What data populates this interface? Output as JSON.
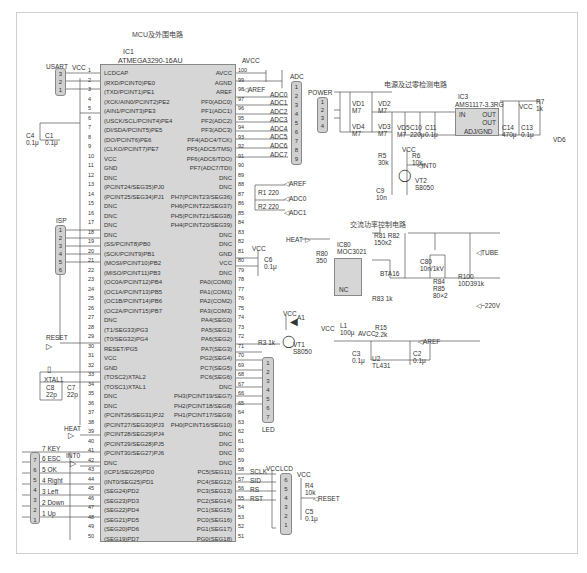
{
  "titles": {
    "mcu": "MCU及外围电路",
    "power": "电源及过零检测电路",
    "ac": "交流功率控制电路"
  },
  "mcu": {
    "ref": "IC1",
    "part": "ATMEGA3290-16AU",
    "left_pins": [
      {
        "n": "1",
        "name": "LCDCAP"
      },
      {
        "n": "2",
        "name": "(RXD/PCINT0)PE0"
      },
      {
        "n": "3",
        "name": "(TXD/PCINT1)PE1"
      },
      {
        "n": "4",
        "name": "(XCK/AIN0/PCINT2)PE2"
      },
      {
        "n": "5",
        "name": "(AIN1/PCINT3)PE3"
      },
      {
        "n": "6",
        "name": "(USCK/SCL/PCINT4)PE4"
      },
      {
        "n": "7",
        "name": "(DI/SDA/PCINT5)PE5"
      },
      {
        "n": "8",
        "name": "(DO/PCINT6)PE6"
      },
      {
        "n": "9",
        "name": "(CLKO/PCINT7)PE7"
      },
      {
        "n": "10",
        "name": "VCC"
      },
      {
        "n": "11",
        "name": "GND"
      },
      {
        "n": "12",
        "name": "DNC"
      },
      {
        "n": "13",
        "name": "(PCINT24/SEG35)PJ0"
      },
      {
        "n": "14",
        "name": "(PCINT25/SEG34)PJ1"
      },
      {
        "n": "15",
        "name": "DNC"
      },
      {
        "n": "16",
        "name": "DNC"
      },
      {
        "n": "17",
        "name": "DNC"
      },
      {
        "n": "18",
        "name": "DNC"
      },
      {
        "n": "19",
        "name": "(SS/PCINT8)PB0"
      },
      {
        "n": "20",
        "name": "(SCK/PCINT9)PB1"
      },
      {
        "n": "21",
        "name": "(MOSI/PCINT10)PB2"
      },
      {
        "n": "22",
        "name": "(MISO/PCINT11)PB3"
      },
      {
        "n": "23",
        "name": "(OC0A/PCINT12)PB4"
      },
      {
        "n": "24",
        "name": "(OC1A/PCINT13)PB5"
      },
      {
        "n": "25",
        "name": "(OC1B/PCINT14)PB6"
      },
      {
        "n": "26",
        "name": "(OC2A/PCINT15)PB7"
      },
      {
        "n": "27",
        "name": "DNC"
      },
      {
        "n": "28",
        "name": "(T1/SEG33)PG3"
      },
      {
        "n": "29",
        "name": "(T0/SEG32)PG4"
      },
      {
        "n": "30",
        "name": "RESET/PG5"
      },
      {
        "n": "31",
        "name": "VCC"
      },
      {
        "n": "32",
        "name": "GND"
      },
      {
        "n": "33",
        "name": "(TOSC2)XTAL2"
      },
      {
        "n": "34",
        "name": "(TOSC1)XTAL1"
      },
      {
        "n": "35",
        "name": "DNC"
      },
      {
        "n": "36",
        "name": "DNC"
      },
      {
        "n": "37",
        "name": "(PCINT26/SEG31)PJ2"
      },
      {
        "n": "38",
        "name": "(PCINT27/SEG30)PJ3"
      },
      {
        "n": "39",
        "name": "(PCINT28/SEG29)PJ4"
      },
      {
        "n": "40",
        "name": "(PCINT29/SEG28)PJ5"
      },
      {
        "n": "41",
        "name": "(PCINT30/SEG27)PJ6"
      },
      {
        "n": "42",
        "name": "DNC"
      },
      {
        "n": "43",
        "name": "(ICP1/SEG26)PD0"
      },
      {
        "n": "44",
        "name": "(INT0/SEG25)PD1"
      },
      {
        "n": "45",
        "name": "(SEG24)PD2"
      },
      {
        "n": "46",
        "name": "(SEG23)PD3"
      },
      {
        "n": "47",
        "name": "(SEG22)PD4"
      },
      {
        "n": "48",
        "name": "(SEG21)PD5"
      },
      {
        "n": "49",
        "name": "(SEG20)PD6"
      },
      {
        "n": "50",
        "name": "(SEG19)PD7"
      }
    ],
    "right_pins": [
      {
        "n": "100",
        "name": "AVCC"
      },
      {
        "n": "99",
        "name": "AGND"
      },
      {
        "n": "98",
        "name": "AREF"
      },
      {
        "n": "97",
        "name": "PF0(ADC0)"
      },
      {
        "n": "96",
        "name": "PF1(ADC1)"
      },
      {
        "n": "95",
        "name": "PF2(ADC2)"
      },
      {
        "n": "94",
        "name": "PF3(ADC3)"
      },
      {
        "n": "93",
        "name": "PF4(ADC4/TCK)"
      },
      {
        "n": "92",
        "name": "PF5(ADC5/TMS)"
      },
      {
        "n": "91",
        "name": "PF6(ADC6/TDO)"
      },
      {
        "n": "90",
        "name": "PF7(ADC7/TDI)"
      },
      {
        "n": "89",
        "name": "DNC"
      },
      {
        "n": "88",
        "name": "DNC"
      },
      {
        "n": "87",
        "name": "PH7(PCINT23/SEG36)"
      },
      {
        "n": "86",
        "name": "PH6(PCINT22/SEG37)"
      },
      {
        "n": "85",
        "name": "PH5(PCINT21/SEG38)"
      },
      {
        "n": "84",
        "name": "PH4(PCINT20/SEG39)"
      },
      {
        "n": "83",
        "name": "DNC"
      },
      {
        "n": "82",
        "name": "DNC"
      },
      {
        "n": "81",
        "name": "GND"
      },
      {
        "n": "80",
        "name": "VCC"
      },
      {
        "n": "79",
        "name": "DNC"
      },
      {
        "n": "78",
        "name": "PA0(COM0)"
      },
      {
        "n": "77",
        "name": "PA1(COM1)"
      },
      {
        "n": "76",
        "name": "PA2(COM2)"
      },
      {
        "n": "75",
        "name": "PA3(COM3)"
      },
      {
        "n": "74",
        "name": "PA4(SEG0)"
      },
      {
        "n": "73",
        "name": "PA5(SEG1)"
      },
      {
        "n": "72",
        "name": "PA6(SEG2)"
      },
      {
        "n": "71",
        "name": "PA7(SEG3)"
      },
      {
        "n": "70",
        "name": "PG2(SEG4)"
      },
      {
        "n": "69",
        "name": "PC7(SEG5)"
      },
      {
        "n": "68",
        "name": "PC6(SEG6)"
      },
      {
        "n": "67",
        "name": "DNC"
      },
      {
        "n": "66",
        "name": "PH3(PCINT19/SEG7)"
      },
      {
        "n": "65",
        "name": "PH2(PCINT18/SEG8)"
      },
      {
        "n": "64",
        "name": "PH1(PCINT17/SEG9)"
      },
      {
        "n": "63",
        "name": "PH0(PCINT16/SEG10)"
      },
      {
        "n": "62",
        "name": "DNC"
      },
      {
        "n": "61",
        "name": "DNC"
      },
      {
        "n": "60",
        "name": "DNC"
      },
      {
        "n": "59",
        "name": "DNC"
      },
      {
        "n": "58",
        "name": "PC5(SEG11)"
      },
      {
        "n": "57",
        "name": "PC4(SEG12)"
      },
      {
        "n": "56",
        "name": "PC3(SEG13)"
      },
      {
        "n": "55",
        "name": "PC2(SEG14)"
      },
      {
        "n": "54",
        "name": "PC1(SEG15)"
      },
      {
        "n": "53",
        "name": "PC0(SEG16)"
      },
      {
        "n": "52",
        "name": "PG1(SEG17)"
      },
      {
        "n": "51",
        "name": "PG0(SEG18)"
      }
    ]
  },
  "connectors": {
    "usart": {
      "label": "USART",
      "pins": [
        "3",
        "2",
        "1"
      ]
    },
    "isp": {
      "label": "ISP",
      "pins": [
        "1",
        "2",
        "3",
        "4",
        "5",
        "6"
      ]
    },
    "adc": {
      "label": "ADC",
      "pins": [
        "1",
        "2",
        "3",
        "4",
        "5",
        "6",
        "7",
        "8",
        "9"
      ]
    },
    "power": {
      "label": "POWER",
      "pins": [
        "1",
        "2",
        "3",
        "4"
      ]
    },
    "led": {
      "label": "LED",
      "pins": [
        "1",
        "2",
        "3",
        "4",
        "5",
        "6",
        "7"
      ]
    },
    "lcd": {
      "label": "LCD",
      "pins": [
        "6",
        "5",
        "4",
        "3",
        "2",
        "1"
      ]
    },
    "keys": {
      "pins": [
        "7",
        "6",
        "5",
        "4",
        "3",
        "2",
        "1"
      ]
    }
  },
  "nets": {
    "vcc": "VCC",
    "avcc": "AVCC",
    "aref": "AREF",
    "heat": "HEAT",
    "int0": "INT0",
    "reset": "RESET",
    "tube": "TUBE",
    "ac220": "~220V",
    "adc": [
      "ADC0",
      "ADC1",
      "ADC2",
      "ADC3",
      "ADC4",
      "ADC5",
      "ADC6",
      "ADC7"
    ],
    "keys": [
      "7 KEY",
      "6 ESC",
      "5 OK",
      "4 Right",
      "3 Left",
      "2 Down",
      "1 Up"
    ],
    "lcd": [
      "SCLK",
      "SID",
      "RS",
      "RST"
    ]
  },
  "components": {
    "c4": {
      "ref": "C4",
      "val": "0.1μ"
    },
    "c1": {
      "ref": "C1",
      "val": "0.1μ"
    },
    "xtal": {
      "ref": "XTAL1"
    },
    "c8": {
      "ref": "C8",
      "val": "22p"
    },
    "c7": {
      "ref": "C7",
      "val": "22p"
    },
    "r1": {
      "ref": "R1",
      "val": "220"
    },
    "r2": {
      "ref": "R2",
      "val": "220"
    },
    "c6": {
      "ref": "C6",
      "val": "0.1μ"
    },
    "a1": {
      "ref": "A1"
    },
    "r3": {
      "ref": "R3",
      "val": "1k"
    },
    "vt1": {
      "ref": "VT1",
      "val": "S8050"
    },
    "vd1": {
      "ref": "VD1",
      "val": "M7"
    },
    "vd2": {
      "ref": "VD2",
      "val": "M7"
    },
    "vd3": {
      "ref": "VD3",
      "val": "M7"
    },
    "vd4": {
      "ref": "VD4",
      "val": "M7"
    },
    "vd5": {
      "ref": "VD5",
      "val": "M7"
    },
    "c10": {
      "ref": "C10",
      "val": "220μ"
    },
    "c11": {
      "ref": "C11",
      "val": "0.1μ"
    },
    "ic3": {
      "ref": "IC3",
      "part": "AMS1117-3.3RG",
      "pins": {
        "in": "IN",
        "out1": "OUT",
        "out2": "OUT",
        "adj": "ADJ/GND",
        "n3": "3",
        "n4": "4",
        "n2": "2",
        "n1": "1"
      }
    },
    "c14": {
      "ref": "C14",
      "val": "470μ"
    },
    "c13": {
      "ref": "C13",
      "val": "0.1μ"
    },
    "r7": {
      "ref": "R7",
      "val": "1k"
    },
    "vd6": {
      "ref": "VD6"
    },
    "r5": {
      "ref": "R5",
      "val": "30k"
    },
    "r6": {
      "ref": "R6",
      "val": "10k"
    },
    "c9": {
      "ref": "C9",
      "val": "10n"
    },
    "vt2": {
      "ref": "VT2",
      "val": "S8050"
    },
    "r80": {
      "ref": "R80",
      "val": "350"
    },
    "ic80": {
      "ref": "IC80",
      "part": "MOC3021",
      "nc": "NC"
    },
    "r81": {
      "ref": "R81 R82",
      "val": "150x2"
    },
    "bta": {
      "ref": "BTA16"
    },
    "c80": {
      "ref": "C80",
      "val": "10n/1kV"
    },
    "r83": {
      "ref": "R83",
      "val": "1k"
    },
    "r84": {
      "ref": "R84"
    },
    "r85": {
      "ref": "R85",
      "val": "80×2"
    },
    "r100": {
      "ref": "R100",
      "val": "10D391k"
    },
    "l1": {
      "ref": "L1",
      "val": "100μ"
    },
    "r15": {
      "ref": "R15",
      "val": "2.2k"
    },
    "c3": {
      "ref": "C3",
      "val": "0.1μ"
    },
    "u2": {
      "ref": "U2",
      "val": "TL431"
    },
    "c2": {
      "ref": "C2",
      "val": "0.1μ"
    },
    "r4": {
      "ref": "R4",
      "val": "10k"
    },
    "c5": {
      "ref": "C5",
      "val": "0.1μ"
    }
  }
}
